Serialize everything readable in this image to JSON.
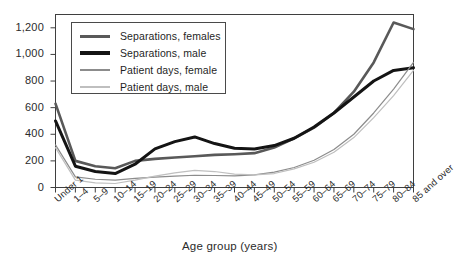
{
  "chart_data": {
    "type": "line",
    "title": "",
    "xlabel": "Age group (years)",
    "ylabel": "",
    "categories": [
      "Under 1",
      "1–4",
      "5–9",
      "10–14",
      "15–19",
      "20–24",
      "25–29",
      "30–34",
      "35–39",
      "40–44",
      "45–49",
      "50–54",
      "55–59",
      "60–64",
      "65–69",
      "70–74",
      "75–79",
      "80–84",
      "85 and over"
    ],
    "ylim": [
      0,
      1300
    ],
    "yticks": [
      0,
      200,
      400,
      600,
      800,
      1000,
      1200
    ],
    "ytick_labels": [
      "0",
      "200",
      "400",
      "600",
      "800",
      "1,000",
      "1,200"
    ],
    "grid": false,
    "legend_position": "top-left",
    "series": [
      {
        "name": "Separations, females",
        "color": "#595959",
        "width": 2.6,
        "values": [
          630,
          200,
          160,
          145,
          200,
          215,
          225,
          235,
          245,
          250,
          258,
          300,
          370,
          450,
          560,
          720,
          940,
          1240,
          1190
        ]
      },
      {
        "name": "Separations, male",
        "color": "#141414",
        "width": 3.0,
        "values": [
          500,
          160,
          120,
          105,
          175,
          290,
          345,
          380,
          330,
          295,
          290,
          315,
          370,
          455,
          560,
          680,
          800,
          880,
          900
        ]
      },
      {
        "name": "Patient days, female",
        "color": "#8c8c8c",
        "width": 1.2,
        "values": [
          320,
          80,
          62,
          55,
          68,
          78,
          85,
          92,
          90,
          88,
          95,
          115,
          150,
          205,
          285,
          400,
          560,
          740,
          940
        ]
      },
      {
        "name": "Patient days, male",
        "color": "#bfbfbf",
        "width": 1.2,
        "values": [
          300,
          55,
          35,
          30,
          55,
          85,
          110,
          128,
          120,
          100,
          95,
          105,
          140,
          190,
          265,
          375,
          525,
          690,
          880
        ]
      }
    ]
  },
  "axis": {
    "x_title": "Age group (years)"
  },
  "legend": {
    "items": [
      {
        "label": "Separations, females",
        "color": "#595959",
        "thickness": "3px"
      },
      {
        "label": "Separations, male",
        "color": "#141414",
        "thickness": "4px"
      },
      {
        "label": "Patient days, female",
        "color": "#8c8c8c",
        "thickness": "1.5px"
      },
      {
        "label": "Patient days, male",
        "color": "#bfbfbf",
        "thickness": "1.5px"
      }
    ]
  }
}
